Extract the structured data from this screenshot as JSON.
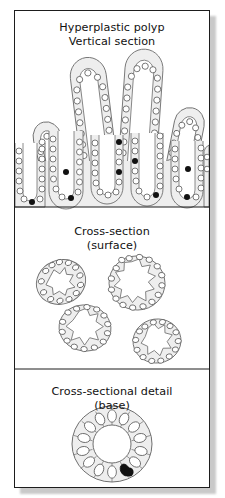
{
  "figure": {
    "title": "Hyperplastic polyp",
    "panels": [
      {
        "id": "vertical",
        "caption_line1": "Hyperplastic polyp",
        "caption_line2": "Vertical section",
        "caption": "Hyperplastic polyp\nVertical section"
      },
      {
        "id": "cross-surface",
        "caption_line1": "Cross-section",
        "caption_line2": "(surface)",
        "caption": "Cross-section\n(surface)"
      },
      {
        "id": "cross-base-detail",
        "caption_line1": "Cross-sectional detail",
        "caption_line2": "(base)",
        "caption": "Cross-sectional detail\n(base)"
      }
    ]
  },
  "colors": {
    "frame_stroke": "#1d1d1d",
    "plate_background": "#ffffff",
    "tissue_fill": "#eeeeee",
    "tissue_stroke": "#6f6f6f",
    "lumen_fill": "#ffffff",
    "nucleus_fill": "#ffffff",
    "nucleus_stroke": "#5a5a5a",
    "dark_nucleus_fill": "#111111",
    "caption_text": "#111111",
    "drop_shadow": "#c9c9c9"
  },
  "vertical_section": {
    "villi": [
      {
        "label": "villus-1",
        "cx": 44,
        "top": 118,
        "width": 34,
        "height": 62,
        "tilt": -14
      },
      {
        "label": "villus-2",
        "cx": 86,
        "top": 60,
        "width": 38,
        "height": 118,
        "tilt": -7
      },
      {
        "label": "villus-3",
        "cx": 132,
        "top": 52,
        "width": 40,
        "height": 126,
        "tilt": 4
      },
      {
        "label": "villus-4",
        "cx": 176,
        "top": 104,
        "width": 34,
        "height": 76,
        "tilt": 10
      }
    ],
    "crypts": [
      {
        "label": "crypt-1",
        "cx": 27,
        "top": 140,
        "width": 32,
        "depth": 62,
        "dark_nuclei": 2
      },
      {
        "label": "crypt-2",
        "cx": 68,
        "top": 120,
        "width": 32,
        "depth": 80,
        "dark_nuclei": 2
      },
      {
        "label": "crypt-3",
        "cx": 110,
        "top": 126,
        "width": 32,
        "depth": 76,
        "dark_nuclei": 2
      },
      {
        "label": "crypt-4",
        "cx": 152,
        "top": 122,
        "width": 32,
        "depth": 80,
        "dark_nuclei": 2
      },
      {
        "label": "crypt-5",
        "cx": 190,
        "top": 140,
        "width": 30,
        "depth": 62,
        "dark_nuclei": 2
      }
    ],
    "dark_nuclei_total": 9,
    "baseline_y": 205
  },
  "cross_sections_surface": {
    "count": 4,
    "circles": [
      {
        "label": "cross-section-1",
        "cx": 60,
        "cy": 281,
        "rx": 25,
        "ry": 22,
        "rotation": -22,
        "nuclei": 13
      },
      {
        "label": "cross-section-2",
        "cx": 136,
        "cy": 282,
        "rx": 28,
        "ry": 27,
        "rotation": 10,
        "nuclei": 15
      },
      {
        "label": "cross-section-3",
        "cx": 84,
        "cy": 327,
        "rx": 26,
        "ry": 23,
        "rotation": 8,
        "nuclei": 14
      },
      {
        "label": "cross-section-4",
        "cx": 156,
        "cy": 340,
        "rx": 24,
        "ry": 22,
        "rotation": -8,
        "nuclei": 13
      }
    ]
  },
  "cross_section_base_detail": {
    "label": "base-detail",
    "cx": 111,
    "cy": 443,
    "outer_rx": 40,
    "outer_ry": 38,
    "lumen_rx": 19,
    "lumen_ry": 19,
    "cell_count": 14,
    "dark_nuclei": 1
  }
}
